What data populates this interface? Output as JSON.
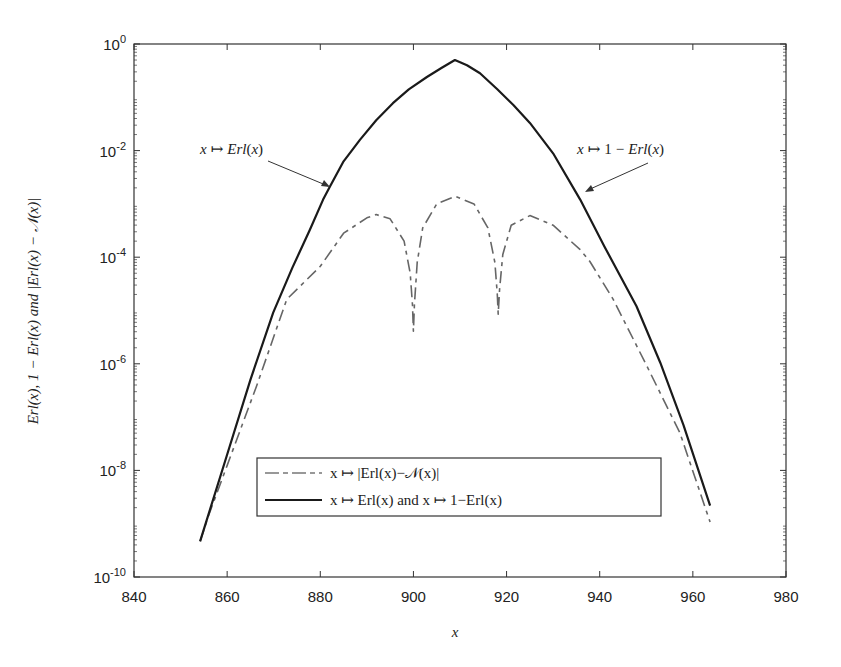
{
  "chart_data": {
    "type": "line",
    "title": "",
    "xlabel": "x",
    "ylabel": "Erl(x), 1 − Erl(x) and |Erl(x) − 𝒩(x)|",
    "xlim": [
      840,
      980
    ],
    "ylim": [
      1e-10,
      1
    ],
    "yscale": "log",
    "grid": false,
    "x_ticks": [
      840,
      860,
      880,
      900,
      920,
      940,
      960,
      980
    ],
    "x_tick_labels": [
      "840",
      "860",
      "880",
      "900",
      "920",
      "940",
      "960",
      "980"
    ],
    "y_ticks_exp": [
      0,
      -2,
      -4,
      -6,
      -8,
      -10
    ],
    "y_tick_labels": [
      {
        "base": "10",
        "exp": "0"
      },
      {
        "base": "10",
        "exp": "-2"
      },
      {
        "base": "10",
        "exp": "-4"
      },
      {
        "base": "10",
        "exp": "-6"
      },
      {
        "base": "10",
        "exp": "-8"
      },
      {
        "base": "10",
        "exp": "-10"
      }
    ],
    "legend_position": "lower center",
    "series": [
      {
        "name": "x ↦ |Erl(x)−𝒩(x)|",
        "style": "dashdot",
        "color": "#666666",
        "x": [
          854.2,
          856.0,
          860.0,
          866.3,
          872.8,
          880.0,
          885.0,
          890.0,
          892.0,
          895.0,
          898.0,
          899.3,
          899.8,
          900.0,
          900.2,
          900.8,
          902.0,
          905.0,
          909.0,
          913.0,
          916.0,
          917.5,
          918.0,
          918.2,
          918.5,
          919.2,
          921.0,
          925.0,
          930.0,
          935.8,
          937.9,
          942.9,
          950.1,
          957.2,
          963.7
        ],
        "log10": [
          -9.33,
          -8.85,
          -7.91,
          -6.42,
          -4.79,
          -4.17,
          -3.55,
          -3.26,
          -3.2,
          -3.28,
          -3.7,
          -4.3,
          -4.9,
          -5.39,
          -4.9,
          -4.1,
          -3.45,
          -3.0,
          -2.86,
          -3.0,
          -3.45,
          -4.1,
          -4.7,
          -5.07,
          -4.6,
          -3.95,
          -3.4,
          -3.22,
          -3.4,
          -3.86,
          -4.08,
          -4.79,
          -6.04,
          -7.29,
          -8.97
        ]
      },
      {
        "name": "x ↦ Erl(x) and x ↦ 1−Erl(x)",
        "style": "solid",
        "color": "#1a1a1a",
        "x": [
          854.2,
          859.9,
          865.0,
          869.9,
          874.0,
          877.8,
          880.6,
          882.1,
          885.0,
          888.5,
          892.0,
          895.6,
          899.0,
          902.9,
          906.0,
          908.9,
          911.5,
          914.3,
          918.0,
          921.5,
          925.0,
          930.0,
          935.8,
          941.0,
          947.9,
          953.0,
          958.0,
          963.7
        ],
        "log10": [
          -9.33,
          -7.73,
          -6.3,
          -5.04,
          -4.2,
          -3.48,
          -2.92,
          -2.67,
          -2.2,
          -1.8,
          -1.43,
          -1.11,
          -0.85,
          -0.62,
          -0.45,
          -0.3,
          -0.4,
          -0.55,
          -0.85,
          -1.15,
          -1.48,
          -2.05,
          -2.92,
          -3.8,
          -4.92,
          -5.98,
          -7.15,
          -8.66
        ]
      }
    ],
    "annotations": [
      {
        "text": "x ↦ Erl(x)",
        "target": [
          882.1,
          -2.67
        ]
      },
      {
        "text": "x ↦ 1 − Erl(x)",
        "target": [
          936.8,
          -2.92
        ]
      }
    ]
  },
  "legend": {
    "item1_label": "x ↦ |Erl(x)−𝒩(x)|",
    "item2_label": "x ↦ Erl(x) and x ↦ 1−Erl(x)"
  }
}
